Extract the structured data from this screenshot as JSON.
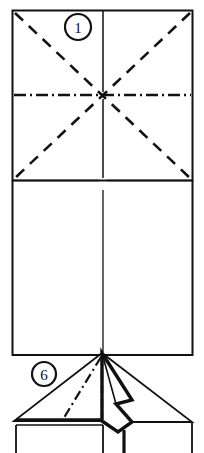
{
  "document": {
    "title": "Origami folding instructions",
    "type": "origami-diagram-sheet",
    "background_color": "#ffffff",
    "ink_color": "#111111"
  },
  "steps": [
    {
      "id": "step-1",
      "number": "1",
      "label_center": {
        "x": 78,
        "y": 27
      },
      "label_radius": 13,
      "caption": "",
      "description": "Square sheet with pre-creases: two diagonals and a horizontal mountain crease, plus a vertical line",
      "lines": {
        "solid": "square outline, vertical center line, horizontal line near bottom",
        "dashed": "both diagonals (valley folds)",
        "dash_dot": "horizontal mid crease (mountain fold)"
      }
    },
    {
      "id": "step-6",
      "number": "6",
      "label_center": {
        "x": 44,
        "y": 374
      },
      "label_radius": 12,
      "caption": "",
      "description": "Three-dimensional view of the folded model with a raised central point",
      "lines": {
        "solid": "model edges",
        "dashed": "hidden vertical edge",
        "dash_dot": "hidden mountain crease",
        "thick": "emphasized front fold edges"
      }
    }
  ],
  "geometry": {
    "sheet_rect": {
      "x": 12,
      "y": 10,
      "width": 181,
      "height": 345
    },
    "vertical_center_line_x": 103,
    "mountain_crease_y": 95,
    "lower_horizontal_line_y": 180,
    "apex": {
      "x": 102,
      "y": 353
    },
    "left_vertex": {
      "x": 14,
      "y": 421
    },
    "right_vertex": {
      "x": 192,
      "y": 422
    }
  },
  "icons": {
    "step-badge": "circled-number-icon"
  }
}
